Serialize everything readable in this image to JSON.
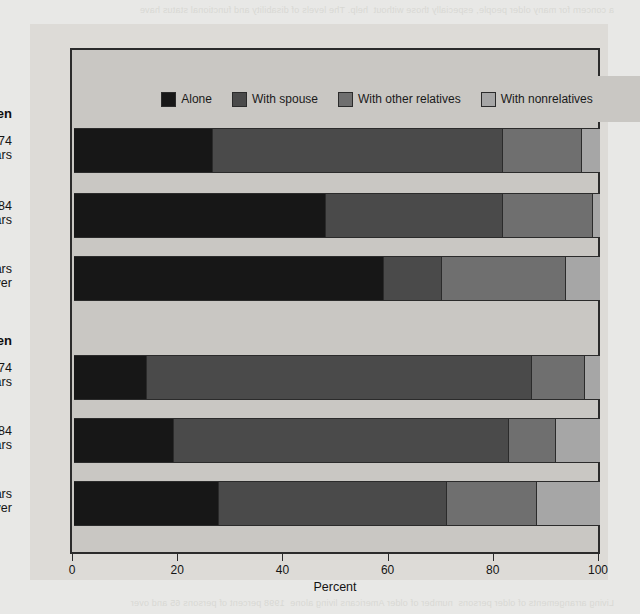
{
  "figure": {
    "background_color": "#dddbd7",
    "plot_background_color": "#c9c7c3",
    "frame_color": "#2b2b2b"
  },
  "bleed_text": {
    "top": "a concern for many older people, especially those without  help. The levels of disability and functional status have",
    "bottom": "Living arrangements of older persons  number of older Americans living alone  1998 percent of persons 65 and over"
  },
  "chart_data": {
    "type": "bar",
    "orientation": "horizontal",
    "stacked": true,
    "title": "",
    "xlabel": "Percent",
    "ylabel": "",
    "xlim": [
      0,
      100
    ],
    "xticks": [
      0,
      20,
      40,
      60,
      80,
      100
    ],
    "xtick_labels": [
      "0",
      "20",
      "40",
      "60",
      "80",
      "100"
    ],
    "grid": false,
    "legend_position": "top",
    "series": [
      {
        "name": "Alone",
        "color": "#171717",
        "values": [
          26.5,
          48.0,
          59.0,
          14.5,
          19.0,
          27.5
        ]
      },
      {
        "name": "With spouse",
        "color": "#4a4a4a",
        "values": [
          55.0,
          33.5,
          11.0,
          76.5,
          63.7,
          43.5
        ]
      },
      {
        "name": "With other relatives",
        "color": "#6f6f6f",
        "values": [
          15.0,
          17.1,
          23.6,
          10.5,
          9.0,
          17.0
        ]
      },
      {
        "name": "With nonrelatives",
        "color": "#a6a6a6",
        "values": [
          3.5,
          1.4,
          6.4,
          3.0,
          8.3,
          12.0
        ]
      }
    ],
    "groups": [
      {
        "label": "Women",
        "categories": [
          {
            "label": "65-74\nyears",
            "values": [
              26.5,
              55.0,
              15.0,
              3.5
            ]
          },
          {
            "label": "75-84\nyears",
            "values": [
              48.0,
              33.5,
              17.1,
              1.4
            ]
          },
          {
            "label": "85 years\nand over",
            "values": [
              59.0,
              11.0,
              23.6,
              6.4
            ]
          }
        ]
      },
      {
        "label": "Men",
        "categories": [
          {
            "label": "65-74\nyears",
            "values": [
              14.5,
              76.5,
              10.5,
              3.0
            ]
          },
          {
            "label": "75-84\nyears",
            "values": [
              19.0,
              63.7,
              9.0,
              8.3
            ]
          },
          {
            "label": "85 years\nand over",
            "values": [
              27.5,
              43.5,
              17.0,
              12.0
            ]
          }
        ]
      }
    ]
  }
}
